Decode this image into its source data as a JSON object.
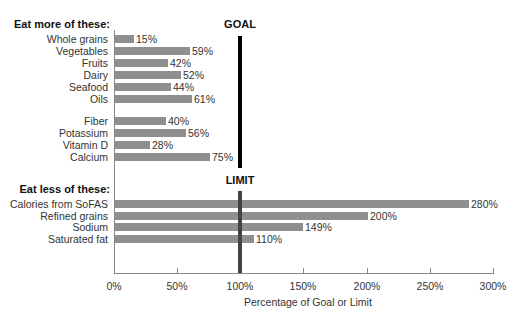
{
  "chart_data": {
    "type": "bar",
    "orientation": "horizontal",
    "title": "",
    "xlabel": "Percentage of Goal or Limit",
    "ylabel": "",
    "xlim": [
      0,
      300
    ],
    "x_ticks": [
      "0%",
      "50%",
      "100%",
      "150%",
      "200%",
      "250%",
      "300%"
    ],
    "grid": false,
    "reference_lines": [
      {
        "label": "GOAL",
        "x": 100,
        "color": "#000000",
        "applies_to": "Eat more of these:"
      },
      {
        "label": "LIMIT",
        "x": 100,
        "color": "#444444",
        "applies_to": "Eat less of these:"
      }
    ],
    "groups": [
      {
        "title": "Eat more of these:",
        "subgroups": [
          {
            "categories": [
              "Whole grains",
              "Vegetables",
              "Fruits",
              "Dairy",
              "Seafood",
              "Oils"
            ],
            "values": [
              15,
              59,
              42,
              52,
              44,
              61
            ]
          },
          {
            "categories": [
              "Fiber",
              "Potassium",
              "Vitamin D",
              "Calcium"
            ],
            "values": [
              40,
              56,
              28,
              75
            ]
          }
        ]
      },
      {
        "title": "Eat less of these:",
        "subgroups": [
          {
            "categories": [
              "Calories from SoFAS",
              "Refined grains",
              "Sodium",
              "Saturated fat"
            ],
            "values": [
              280,
              200,
              149,
              110
            ]
          }
        ]
      }
    ],
    "bar_color": "#8f8f8f"
  },
  "labels": {
    "more_title": "Eat more of these:",
    "less_title": "Eat less of these:",
    "goal": "GOAL",
    "limit": "LIMIT",
    "xlabel": "Percentage of Goal or Limit"
  },
  "rows": [
    {
      "label": "Whole grains",
      "value": 15,
      "text": "15%",
      "y": 39
    },
    {
      "label": "Vegetables",
      "value": 59,
      "text": "59%",
      "y": 51
    },
    {
      "label": "Fruits",
      "value": 42,
      "text": "42%",
      "y": 63
    },
    {
      "label": "Dairy",
      "value": 52,
      "text": "52%",
      "y": 75
    },
    {
      "label": "Seafood",
      "value": 44,
      "text": "44%",
      "y": 87
    },
    {
      "label": "Oils",
      "value": 61,
      "text": "61%",
      "y": 99
    },
    {
      "label": "Fiber",
      "value": 40,
      "text": "40%",
      "y": 121
    },
    {
      "label": "Potassium",
      "value": 56,
      "text": "56%",
      "y": 133
    },
    {
      "label": "Vitamin D",
      "value": 28,
      "text": "28%",
      "y": 145
    },
    {
      "label": "Calcium",
      "value": 75,
      "text": "75%",
      "y": 157
    },
    {
      "label": "Calories from SoFAS",
      "value": 280,
      "text": "280%",
      "y": 204
    },
    {
      "label": "Refined grains",
      "value": 200,
      "text": "200%",
      "y": 216
    },
    {
      "label": "Sodium",
      "value": 149,
      "text": "149%",
      "y": 227
    },
    {
      "label": "Saturated fat",
      "value": 110,
      "text": "110%",
      "y": 239
    }
  ],
  "ticks": [
    {
      "label": "0%",
      "value": 0
    },
    {
      "label": "50%",
      "value": 50
    },
    {
      "label": "100%",
      "value": 100
    },
    {
      "label": "150%",
      "value": 150
    },
    {
      "label": "200%",
      "value": 200
    },
    {
      "label": "250%",
      "value": 250
    },
    {
      "label": "300%",
      "value": 300
    }
  ]
}
